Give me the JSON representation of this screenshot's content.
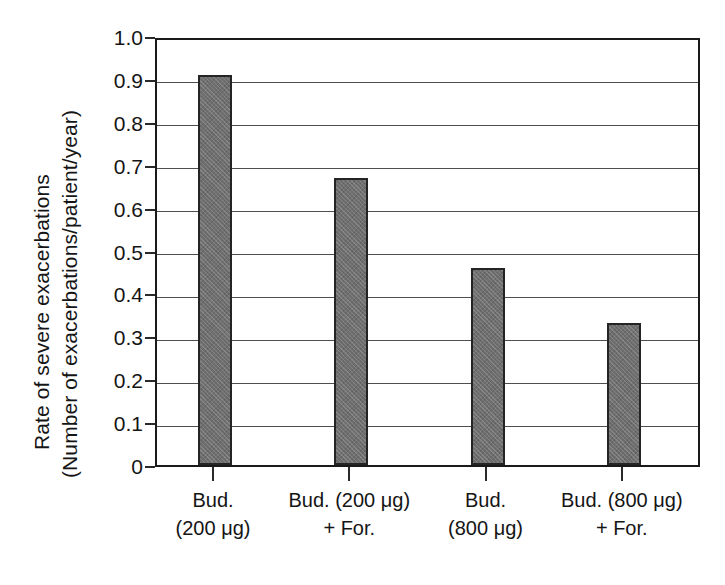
{
  "chart_data": {
    "type": "bar",
    "title": "",
    "subtitle": "",
    "xlabel": "",
    "ylabel": "Rate of severe exacerbations (Number of exacerbations/patient/year)",
    "ylabel_lines": [
      "Rate of severe exacerbations",
      "(Number of exacerbations/patient/year)"
    ],
    "categories": [
      "Bud. (200 μg)",
      "Bud. (200 μg) + For.",
      "Bud. (800 μg)",
      "Bud. (800 μg) + For."
    ],
    "category_lines": [
      {
        "line1": "Bud.",
        "line2": "(200 μg)"
      },
      {
        "line1": "Bud. (200 μg)",
        "line2": "+ For."
      },
      {
        "line1": "Bud.",
        "line2": "(800 μg)"
      },
      {
        "line1": "Bud. (800 μg)",
        "line2": "+ For."
      }
    ],
    "values": [
      0.91,
      0.67,
      0.46,
      0.33
    ],
    "ylim": [
      0,
      1.0
    ],
    "ytick_values": [
      1.0,
      0.9,
      0.8,
      0.7,
      0.6,
      0.5,
      0.4,
      0.3,
      0.2,
      0.1,
      0
    ],
    "ytick_labels": [
      "1.0",
      "0.9",
      "0.8",
      "0.7",
      "0.6",
      "0.5",
      "0.4",
      "0.3",
      "0.2",
      "0.1",
      "0"
    ],
    "grid": true,
    "grid_axis": "y",
    "legend": false,
    "legend_position": "none",
    "bar_color": "#6f6f6f",
    "bar_edge_color": "#242424",
    "grid_color": "#4f4f4f",
    "frame_color": "#1a1a1a",
    "background_color": "#ffffff",
    "text_color": "#151515"
  }
}
